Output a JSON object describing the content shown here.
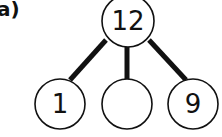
{
  "figure_label": "a)",
  "tree": {
    "root": {
      "label": "12",
      "cx": 128,
      "cy": 21,
      "r": 26
    },
    "children": [
      {
        "label": "1",
        "cx": 60,
        "cy": 104,
        "r": 25
      },
      {
        "label": "",
        "cx": 127,
        "cy": 104,
        "r": 25
      },
      {
        "label": "9",
        "cx": 193,
        "cy": 104,
        "r": 25
      }
    ],
    "edges": [
      {
        "x1": 106,
        "y1": 40,
        "x2": 70,
        "y2": 80
      },
      {
        "x1": 127,
        "y1": 46,
        "x2": 127,
        "y2": 80
      },
      {
        "x1": 149,
        "y1": 40,
        "x2": 186,
        "y2": 80
      }
    ]
  },
  "colors": {
    "stroke": "#111111",
    "fill": "#ffffff"
  }
}
